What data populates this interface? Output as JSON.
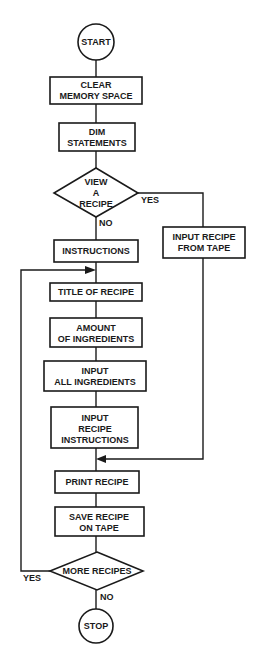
{
  "diagram": {
    "type": "flowchart",
    "nodes": {
      "start": {
        "shape": "circle",
        "label": "START"
      },
      "clear_memory": {
        "shape": "process",
        "lines": [
          "CLEAR",
          "MEMORY SPACE"
        ]
      },
      "dim_statements": {
        "shape": "process",
        "lines": [
          "DIM",
          "STATEMENTS"
        ]
      },
      "view_recipe": {
        "shape": "decision",
        "lines": [
          "VIEW",
          "A",
          "RECIPE"
        ]
      },
      "input_from_tape": {
        "shape": "process",
        "lines": [
          "INPUT RECIPE",
          "FROM TAPE"
        ]
      },
      "instructions": {
        "shape": "process",
        "lines": [
          "INSTRUCTIONS"
        ]
      },
      "title_of_recipe": {
        "shape": "process",
        "lines": [
          "TITLE OF RECIPE"
        ]
      },
      "amount_of_ingredients": {
        "shape": "process",
        "lines": [
          "AMOUNT",
          "OF INGREDIENTS"
        ]
      },
      "input_all_ingredients": {
        "shape": "process",
        "lines": [
          "INPUT",
          "ALL INGREDIENTS"
        ]
      },
      "input_recipe_instructions": {
        "shape": "process",
        "lines": [
          "INPUT",
          "RECIPE",
          "INSTRUCTIONS"
        ]
      },
      "print_recipe": {
        "shape": "process",
        "lines": [
          "PRINT RECIPE"
        ]
      },
      "save_recipe": {
        "shape": "process",
        "lines": [
          "SAVE RECIPE",
          "ON TAPE"
        ]
      },
      "more_recipes": {
        "shape": "decision",
        "lines": [
          "MORE RECIPES"
        ]
      },
      "stop": {
        "shape": "circle",
        "label": "STOP"
      }
    },
    "edge_labels": {
      "view_yes": "YES",
      "view_no": "NO",
      "more_yes": "YES",
      "more_no": "NO"
    },
    "edges": [
      {
        "from": "start",
        "to": "clear_memory"
      },
      {
        "from": "clear_memory",
        "to": "dim_statements"
      },
      {
        "from": "dim_statements",
        "to": "view_recipe"
      },
      {
        "from": "view_recipe",
        "to": "input_from_tape",
        "label": "YES"
      },
      {
        "from": "view_recipe",
        "to": "instructions",
        "label": "NO"
      },
      {
        "from": "instructions",
        "to": "title_of_recipe"
      },
      {
        "from": "title_of_recipe",
        "to": "amount_of_ingredients"
      },
      {
        "from": "amount_of_ingredients",
        "to": "input_all_ingredients"
      },
      {
        "from": "input_all_ingredients",
        "to": "input_recipe_instructions"
      },
      {
        "from": "input_recipe_instructions",
        "to": "print_recipe"
      },
      {
        "from": "input_from_tape",
        "to": "print_recipe"
      },
      {
        "from": "print_recipe",
        "to": "save_recipe"
      },
      {
        "from": "save_recipe",
        "to": "more_recipes"
      },
      {
        "from": "more_recipes",
        "to": "title_of_recipe",
        "label": "YES"
      },
      {
        "from": "more_recipes",
        "to": "stop",
        "label": "NO"
      }
    ]
  },
  "colors": {
    "ink": "#1a1a1a",
    "background": "#ffffff"
  }
}
